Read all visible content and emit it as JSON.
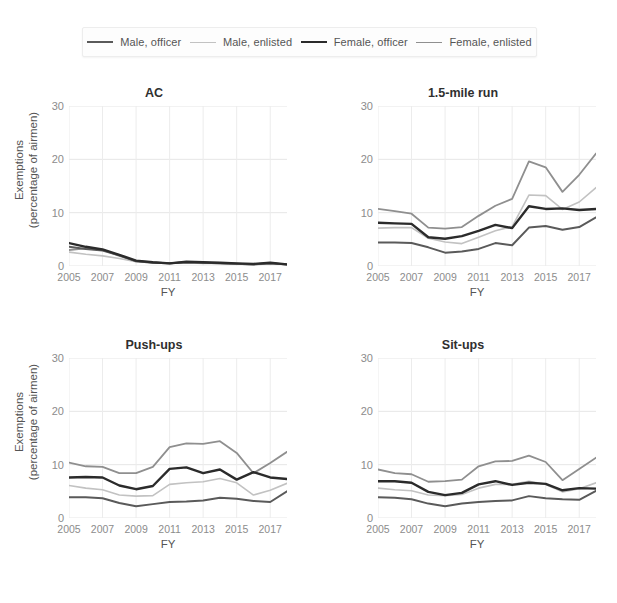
{
  "legend": {
    "entries": [
      {
        "label": "Male, officer",
        "color": "#5a5a5a",
        "width": 2.0
      },
      {
        "label": "Male, enlisted",
        "color": "#c2c2c2",
        "width": 1.6
      },
      {
        "label": "Female, officer",
        "color": "#2b2b2b",
        "width": 2.4
      },
      {
        "label": "Female, enlisted",
        "color": "#8f8f8f",
        "width": 1.8
      }
    ]
  },
  "axes": {
    "ylabel_line1": "Exemptions",
    "ylabel_line2": "(percentage of airmen)",
    "xlabel": "FY",
    "yticks": [
      "30",
      "20",
      "10",
      "0"
    ],
    "ytick_values": [
      30,
      20,
      10,
      0
    ],
    "xticks": [
      "2005",
      "2007",
      "2009",
      "2011",
      "2013",
      "2015",
      "2017"
    ],
    "xtick_values": [
      2005,
      2007,
      2009,
      2011,
      2013,
      2015,
      2017
    ],
    "ylim": [
      0,
      30
    ],
    "xlim": [
      2005,
      2018
    ]
  },
  "panels": {
    "ac": {
      "title": "AC"
    },
    "run": {
      "title": "1.5-mile run"
    },
    "pushups": {
      "title": "Push-ups"
    },
    "situps": {
      "title": "Sit-ups"
    }
  },
  "chart_data": [
    {
      "type": "line",
      "title": "AC",
      "xlabel": "FY",
      "ylabel": "Exemptions (percentage of airmen)",
      "xlim": [
        2005,
        2018
      ],
      "ylim": [
        0,
        30
      ],
      "grid": true,
      "legend_position": "top",
      "x": [
        2005,
        2006,
        2007,
        2008,
        2009,
        2010,
        2011,
        2012,
        2013,
        2014,
        2015,
        2016,
        2017,
        2018
      ],
      "series": [
        {
          "name": "Male, officer",
          "color": "#5a5a5a",
          "values": [
            3.6,
            3.2,
            2.9,
            2.0,
            0.9,
            0.6,
            0.5,
            0.7,
            0.6,
            0.5,
            0.4,
            0.3,
            0.5,
            0.3
          ]
        },
        {
          "name": "Male, enlisted",
          "color": "#c2c2c2",
          "values": [
            2.6,
            2.2,
            1.9,
            1.4,
            0.8,
            0.6,
            0.5,
            0.6,
            0.5,
            0.5,
            0.4,
            0.2,
            0.5,
            0.3
          ]
        },
        {
          "name": "Female, officer",
          "color": "#2b2b2b",
          "values": [
            4.3,
            3.6,
            3.1,
            2.1,
            1.0,
            0.7,
            0.5,
            0.8,
            0.7,
            0.6,
            0.5,
            0.4,
            0.6,
            0.3
          ]
        },
        {
          "name": "Female, enlisted",
          "color": "#8f8f8f",
          "values": [
            3.0,
            3.3,
            3.0,
            1.9,
            0.9,
            0.7,
            0.5,
            0.7,
            0.6,
            0.5,
            0.4,
            0.3,
            0.5,
            0.3
          ]
        }
      ]
    },
    {
      "type": "line",
      "title": "1.5-mile run",
      "xlabel": "FY",
      "ylabel": "Exemptions (percentage of airmen)",
      "xlim": [
        2005,
        2018
      ],
      "ylim": [
        0,
        30
      ],
      "grid": true,
      "legend_position": "top",
      "x": [
        2005,
        2006,
        2007,
        2008,
        2009,
        2010,
        2011,
        2012,
        2013,
        2014,
        2015,
        2016,
        2017,
        2018
      ],
      "series": [
        {
          "name": "Male, officer",
          "color": "#5a5a5a",
          "values": [
            4.4,
            4.4,
            4.3,
            3.5,
            2.5,
            2.7,
            3.2,
            4.3,
            3.9,
            7.2,
            7.5,
            6.8,
            7.3,
            9.1
          ]
        },
        {
          "name": "Male, enlisted",
          "color": "#c2c2c2",
          "values": [
            7.1,
            7.2,
            7.2,
            5.2,
            4.5,
            4.2,
            5.4,
            6.6,
            7.4,
            13.3,
            13.2,
            10.6,
            12.0,
            14.7
          ]
        },
        {
          "name": "Female, officer",
          "color": "#2b2b2b",
          "values": [
            8.1,
            8.0,
            7.9,
            5.4,
            5.1,
            5.6,
            6.6,
            7.7,
            7.1,
            11.2,
            10.7,
            10.8,
            10.5,
            10.7
          ]
        },
        {
          "name": "Female, enlisted",
          "color": "#8f8f8f",
          "values": [
            10.7,
            10.3,
            9.8,
            7.2,
            7.0,
            7.3,
            9.4,
            11.3,
            12.6,
            19.6,
            18.5,
            13.9,
            17.1,
            21.1
          ]
        }
      ]
    },
    {
      "type": "line",
      "title": "Push-ups",
      "xlabel": "FY",
      "ylabel": "Exemptions (percentage of airmen)",
      "xlim": [
        2005,
        2018
      ],
      "ylim": [
        0,
        30
      ],
      "grid": true,
      "legend_position": "top",
      "x": [
        2005,
        2006,
        2007,
        2008,
        2009,
        2010,
        2011,
        2012,
        2013,
        2014,
        2015,
        2016,
        2017,
        2018
      ],
      "series": [
        {
          "name": "Male, officer",
          "color": "#5a5a5a",
          "values": [
            3.9,
            3.9,
            3.7,
            2.8,
            2.2,
            2.6,
            3.0,
            3.1,
            3.3,
            3.8,
            3.6,
            3.2,
            3.0,
            5.0
          ]
        },
        {
          "name": "Male, enlisted",
          "color": "#c2c2c2",
          "values": [
            6.1,
            5.6,
            5.3,
            4.3,
            4.1,
            4.2,
            6.3,
            6.6,
            6.8,
            7.4,
            6.6,
            4.3,
            5.2,
            6.5
          ]
        },
        {
          "name": "Female, officer",
          "color": "#2b2b2b",
          "values": [
            7.6,
            7.7,
            7.6,
            6.1,
            5.4,
            6.0,
            9.2,
            9.5,
            8.4,
            9.1,
            7.2,
            8.6,
            7.6,
            7.3
          ]
        },
        {
          "name": "Female, enlisted",
          "color": "#8f8f8f",
          "values": [
            10.4,
            9.7,
            9.6,
            8.4,
            8.4,
            9.6,
            13.3,
            14.0,
            13.9,
            14.4,
            12.2,
            8.4,
            10.3,
            12.4
          ]
        }
      ]
    },
    {
      "type": "line",
      "title": "Sit-ups",
      "xlabel": "FY",
      "ylabel": "Exemptions (percentage of airmen)",
      "xlim": [
        2005,
        2018
      ],
      "ylim": [
        0,
        30
      ],
      "grid": true,
      "legend_position": "top",
      "x": [
        2005,
        2006,
        2007,
        2008,
        2009,
        2010,
        2011,
        2012,
        2013,
        2014,
        2015,
        2016,
        2017,
        2018
      ],
      "series": [
        {
          "name": "Male, officer",
          "color": "#5a5a5a",
          "values": [
            3.9,
            3.8,
            3.5,
            2.7,
            2.2,
            2.7,
            3.0,
            3.2,
            3.3,
            4.1,
            3.7,
            3.5,
            3.4,
            5.1
          ]
        },
        {
          "name": "Male, enlisted",
          "color": "#c2c2c2",
          "values": [
            5.6,
            5.3,
            5.1,
            4.3,
            4.2,
            4.4,
            5.6,
            6.3,
            6.3,
            6.9,
            6.3,
            4.9,
            5.5,
            6.6
          ]
        },
        {
          "name": "Female, officer",
          "color": "#2b2b2b",
          "values": [
            6.9,
            6.9,
            6.6,
            4.9,
            4.3,
            4.7,
            6.3,
            6.9,
            6.2,
            6.6,
            6.4,
            5.2,
            5.6,
            5.5
          ]
        },
        {
          "name": "Female, enlisted",
          "color": "#8f8f8f",
          "values": [
            9.1,
            8.4,
            8.2,
            6.8,
            6.9,
            7.2,
            9.7,
            10.6,
            10.7,
            11.7,
            10.5,
            7.1,
            9.2,
            11.3
          ]
        }
      ]
    }
  ]
}
